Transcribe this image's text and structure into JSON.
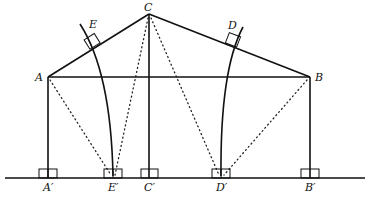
{
  "diagram": {
    "type": "geometry",
    "points": {
      "A": {
        "label": "A",
        "x": 48,
        "y": 77
      },
      "B": {
        "label": "B",
        "x": 310,
        "y": 77
      },
      "C": {
        "label": "C",
        "x": 149,
        "y": 14
      },
      "D": {
        "label": "D",
        "x": 232,
        "y": 43
      },
      "E": {
        "label": "E",
        "x": 93,
        "y": 44
      },
      "A_prime": {
        "label": "A′",
        "x": 48,
        "y": 178
      },
      "E_prime": {
        "label": "E′",
        "x": 113,
        "y": 178
      },
      "C_prime": {
        "label": "C′",
        "x": 149,
        "y": 178
      },
      "D_prime": {
        "label": "D′",
        "x": 221,
        "y": 178
      },
      "B_prime": {
        "label": "B′",
        "x": 310,
        "y": 178
      }
    },
    "segments_solid": [
      "AC",
      "CB",
      "AB",
      "AA′",
      "CC′",
      "BB′",
      "ground line"
    ],
    "segments_dotted": [
      "AE′",
      "CE′",
      "CD′",
      "BD′"
    ],
    "curves": [
      "arc through E to E′",
      "arc through D to D′"
    ],
    "right_angle_marks": [
      "E",
      "D",
      "A′",
      "E′",
      "C′",
      "D′",
      "B′"
    ]
  }
}
